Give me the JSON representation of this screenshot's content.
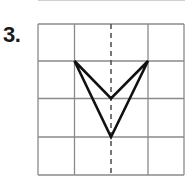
{
  "problem": {
    "number_label": "3."
  },
  "grid": {
    "columns": 4,
    "rows": 4,
    "x_lines": [
      38,
      74.5,
      111,
      148,
      184
    ],
    "y_lines": [
      24,
      61,
      98.5,
      137,
      175
    ],
    "line_color": "#8a8a8a"
  },
  "symmetry_line": {
    "x": 111,
    "style": "dashed",
    "color": "#555555"
  },
  "shape": {
    "type": "concave quadrilateral (arrowhead)",
    "vertices": [
      [
        74.5,
        61
      ],
      [
        111,
        98.5
      ],
      [
        148,
        61
      ],
      [
        111,
        137
      ]
    ],
    "stroke_color": "#111111"
  }
}
